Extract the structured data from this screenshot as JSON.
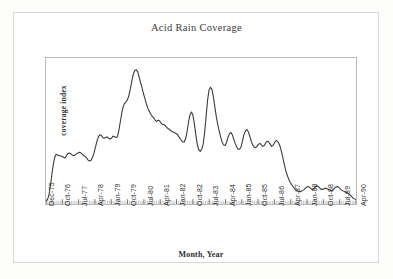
{
  "chart_data": {
    "type": "line",
    "title": "Acid Rain Coverage",
    "xlabel": "Month, Year",
    "ylabel": "coverage index",
    "grid": false,
    "legend": null,
    "axis": {
      "x_tick_interval_months": 9,
      "x_minor_tick_interval_months": 1,
      "y_tick_labels_shown": false,
      "ylim": [
        0,
        1
      ],
      "x_start": "Dec-75",
      "x_end": "Apr-90"
    },
    "tick_labels": [
      "Dec-75",
      "Oct-76",
      "Jul-77",
      "Apr-78",
      "Jan-79",
      "Oct-79",
      "Jul-80",
      "Apr-81",
      "Jan-82",
      "Oct-82",
      "Jul-83",
      "Apr-84",
      "Jan-85",
      "Oct-85",
      "Jul-86",
      "Apr-87",
      "Jan-88",
      "Oct-88",
      "Jul-89",
      "Apr-90"
    ],
    "series": [
      {
        "name": "coverage index",
        "color": "#3a3a3a",
        "values": [
          0.02,
          0.03,
          0.06,
          0.12,
          0.2,
          0.27,
          0.32,
          0.34,
          0.335,
          0.33,
          0.33,
          0.325,
          0.32,
          0.315,
          0.33,
          0.345,
          0.35,
          0.345,
          0.335,
          0.33,
          0.335,
          0.345,
          0.35,
          0.355,
          0.35,
          0.34,
          0.33,
          0.325,
          0.315,
          0.3,
          0.295,
          0.3,
          0.32,
          0.35,
          0.39,
          0.43,
          0.46,
          0.475,
          0.47,
          0.455,
          0.45,
          0.455,
          0.46,
          0.45,
          0.445,
          0.45,
          0.465,
          0.46,
          0.455,
          0.46,
          0.5,
          0.56,
          0.62,
          0.665,
          0.69,
          0.7,
          0.715,
          0.745,
          0.79,
          0.845,
          0.89,
          0.915,
          0.92,
          0.905,
          0.87,
          0.83,
          0.795,
          0.755,
          0.72,
          0.685,
          0.655,
          0.635,
          0.615,
          0.6,
          0.59,
          0.575,
          0.565,
          0.575,
          0.57,
          0.555,
          0.545,
          0.545,
          0.535,
          0.525,
          0.515,
          0.51,
          0.5,
          0.495,
          0.49,
          0.485,
          0.48,
          0.465,
          0.45,
          0.435,
          0.425,
          0.425,
          0.45,
          0.5,
          0.565,
          0.615,
          0.63,
          0.605,
          0.545,
          0.47,
          0.405,
          0.37,
          0.36,
          0.375,
          0.41,
          0.49,
          0.6,
          0.71,
          0.78,
          0.8,
          0.785,
          0.735,
          0.665,
          0.6,
          0.545,
          0.5,
          0.46,
          0.425,
          0.405,
          0.4,
          0.42,
          0.455,
          0.48,
          0.49,
          0.475,
          0.445,
          0.415,
          0.39,
          0.375,
          0.375,
          0.39,
          0.43,
          0.475,
          0.5,
          0.51,
          0.495,
          0.465,
          0.43,
          0.405,
          0.39,
          0.385,
          0.395,
          0.41,
          0.415,
          0.405,
          0.395,
          0.4,
          0.42,
          0.43,
          0.425,
          0.41,
          0.395,
          0.4,
          0.42,
          0.435,
          0.43,
          0.415,
          0.39,
          0.35,
          0.305,
          0.26,
          0.22,
          0.19,
          0.165,
          0.145,
          0.13,
          0.115,
          0.105,
          0.095,
          0.09,
          0.085,
          0.085,
          0.09,
          0.095,
          0.105,
          0.115,
          0.12,
          0.115,
          0.105,
          0.1,
          0.105,
          0.115,
          0.125,
          0.12,
          0.11,
          0.1,
          0.1,
          0.105,
          0.11,
          0.105,
          0.1,
          0.095,
          0.09,
          0.095,
          0.105,
          0.115,
          0.12,
          0.115,
          0.105,
          0.095,
          0.09,
          0.085,
          0.08,
          0.075,
          0.07,
          0.06,
          0.05,
          0.04,
          0.035,
          0.03
        ]
      }
    ]
  }
}
